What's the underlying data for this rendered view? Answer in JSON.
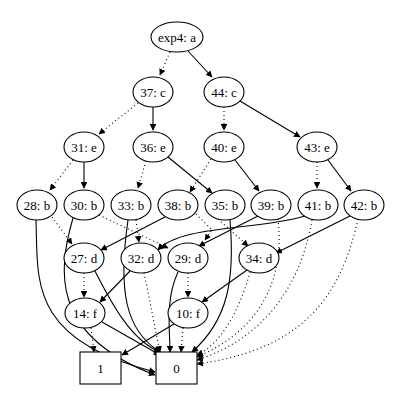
{
  "graph": {
    "title": "BDD graph",
    "nodes": [
      {
        "id": "exp4",
        "label": "exp4: a",
        "shape": "ellipse",
        "x": 177,
        "y": 37,
        "rx": 26,
        "ry": 15
      },
      {
        "id": "37",
        "label": "37: c",
        "shape": "ellipse",
        "x": 153,
        "y": 92,
        "rx": 20,
        "ry": 15
      },
      {
        "id": "44",
        "label": "44: c",
        "shape": "ellipse",
        "x": 224,
        "y": 92,
        "rx": 20,
        "ry": 15
      },
      {
        "id": "31",
        "label": "31: e",
        "shape": "ellipse",
        "x": 84,
        "y": 147,
        "rx": 20,
        "ry": 15
      },
      {
        "id": "36",
        "label": "36: e",
        "shape": "ellipse",
        "x": 153,
        "y": 147,
        "rx": 20,
        "ry": 15
      },
      {
        "id": "40",
        "label": "40: e",
        "shape": "ellipse",
        "x": 224,
        "y": 147,
        "rx": 20,
        "ry": 15
      },
      {
        "id": "43",
        "label": "43: e",
        "shape": "ellipse",
        "x": 317,
        "y": 147,
        "rx": 20,
        "ry": 15
      },
      {
        "id": "28",
        "label": "28: b",
        "shape": "ellipse",
        "x": 37,
        "y": 205,
        "rx": 20,
        "ry": 15
      },
      {
        "id": "30",
        "label": "30: b",
        "shape": "ellipse",
        "x": 84,
        "y": 205,
        "rx": 20,
        "ry": 15
      },
      {
        "id": "33",
        "label": "33: b",
        "shape": "ellipse",
        "x": 131,
        "y": 205,
        "rx": 20,
        "ry": 15
      },
      {
        "id": "38",
        "label": "38: b",
        "shape": "ellipse",
        "x": 178,
        "y": 205,
        "rx": 20,
        "ry": 15
      },
      {
        "id": "35",
        "label": "35: b",
        "shape": "ellipse",
        "x": 225,
        "y": 205,
        "rx": 20,
        "ry": 15
      },
      {
        "id": "39",
        "label": "39: b",
        "shape": "ellipse",
        "x": 271,
        "y": 205,
        "rx": 20,
        "ry": 15
      },
      {
        "id": "41",
        "label": "41: b",
        "shape": "ellipse",
        "x": 318,
        "y": 205,
        "rx": 20,
        "ry": 15
      },
      {
        "id": "42",
        "label": "42: b",
        "shape": "ellipse",
        "x": 364,
        "y": 205,
        "rx": 20,
        "ry": 15
      },
      {
        "id": "27",
        "label": "27: d",
        "shape": "ellipse",
        "x": 84,
        "y": 258,
        "rx": 20,
        "ry": 15
      },
      {
        "id": "32",
        "label": "32: d",
        "shape": "ellipse",
        "x": 141,
        "y": 258,
        "rx": 20,
        "ry": 15
      },
      {
        "id": "29",
        "label": "29: d",
        "shape": "ellipse",
        "x": 188,
        "y": 258,
        "rx": 20,
        "ry": 15
      },
      {
        "id": "34",
        "label": "34: d",
        "shape": "ellipse",
        "x": 259,
        "y": 258,
        "rx": 20,
        "ry": 15
      },
      {
        "id": "14",
        "label": "14: f",
        "shape": "ellipse",
        "x": 85,
        "y": 313,
        "rx": 20,
        "ry": 15
      },
      {
        "id": "10",
        "label": "10: f",
        "shape": "ellipse",
        "x": 188,
        "y": 313,
        "rx": 20,
        "ry": 15
      },
      {
        "id": "one",
        "label": "1",
        "shape": "box",
        "x": 80,
        "y": 352,
        "w": 41,
        "h": 32
      },
      {
        "id": "zero",
        "label": "0",
        "shape": "box",
        "x": 156,
        "y": 352,
        "w": 41,
        "h": 32
      }
    ],
    "edges": [
      {
        "d": "M170,52 L160,75",
        "style": "dot"
      },
      {
        "d": "M188,51 L212,77",
        "style": "solid"
      },
      {
        "d": "M138,103 L99,134",
        "style": "dot"
      },
      {
        "d": "M153,107 L153,130",
        "style": "solid"
      },
      {
        "d": "M224,107 L224,130",
        "style": "dot"
      },
      {
        "d": "M240,101 L300,137",
        "style": "solid"
      },
      {
        "d": "M73,160 L50,190",
        "style": "dot"
      },
      {
        "d": "M84,162 L84,188",
        "style": "solid"
      },
      {
        "d": "M146,161 L138,188",
        "style": "dot"
      },
      {
        "d": "M168,157 L212,193",
        "style": "solid"
      },
      {
        "d": "M211,159 L190,192",
        "style": "dot"
      },
      {
        "d": "M235,160 L259,191",
        "style": "solid"
      },
      {
        "d": "M317,162 L317,188",
        "style": "dot"
      },
      {
        "d": "M328,160 L351,191",
        "style": "solid"
      },
      {
        "d": "M52,217 L72,244",
        "style": "dot"
      },
      {
        "d": "M36,220 C38,280 28,340 155,372",
        "style": "solid"
      },
      {
        "d": "M73,218 C58,270 50,335 155,375",
        "style": "solid"
      },
      {
        "d": "M99,215 L168,248",
        "style": "dot"
      },
      {
        "d": "M128,220 C118,290 125,330 160,352",
        "style": "solid"
      },
      {
        "d": "M136,220 L139,242",
        "style": "dot"
      },
      {
        "d": "M165,217 L101,250",
        "style": "solid"
      },
      {
        "d": "M196,214 L212,230 L205,240",
        "style": "dot"
      },
      {
        "d": "M230,220 C235,280 228,320 192,352",
        "style": "solid"
      },
      {
        "d": "M218,219 L248,246",
        "style": "dot"
      },
      {
        "d": "M260,215 L199,246",
        "style": "solid"
      },
      {
        "d": "M278,219 C285,280 260,330 197,357",
        "style": "dot"
      },
      {
        "d": "M305,216 C260,230 180,225 158,250",
        "style": "solid"
      },
      {
        "d": "M312,220 C300,290 260,340 197,360",
        "style": "dot"
      },
      {
        "d": "M350,216 L276,253",
        "style": "solid"
      },
      {
        "d": "M358,219 C340,300 300,350 197,364",
        "style": "dot"
      },
      {
        "d": "M84,273 L84,297",
        "style": "dot"
      },
      {
        "d": "M95,271 C110,300 130,340 160,352",
        "style": "solid"
      },
      {
        "d": "M144,273 C150,300 155,330 160,352",
        "style": "dot"
      },
      {
        "d": "M130,271 L100,302",
        "style": "solid"
      },
      {
        "d": "M188,273 L188,297",
        "style": "dot"
      },
      {
        "d": "M178,272 C165,300 170,330 170,352",
        "style": "solid"
      },
      {
        "d": "M247,270 L202,302",
        "style": "solid"
      },
      {
        "d": "M250,272 C240,310 220,345 197,355",
        "style": "dot"
      },
      {
        "d": "M91,328 L94,352",
        "style": "dot"
      },
      {
        "d": "M102,322 L160,355",
        "style": "solid"
      },
      {
        "d": "M183,328 L181,352",
        "style": "dot"
      },
      {
        "d": "M174,324 L122,355",
        "style": "solid"
      }
    ]
  }
}
